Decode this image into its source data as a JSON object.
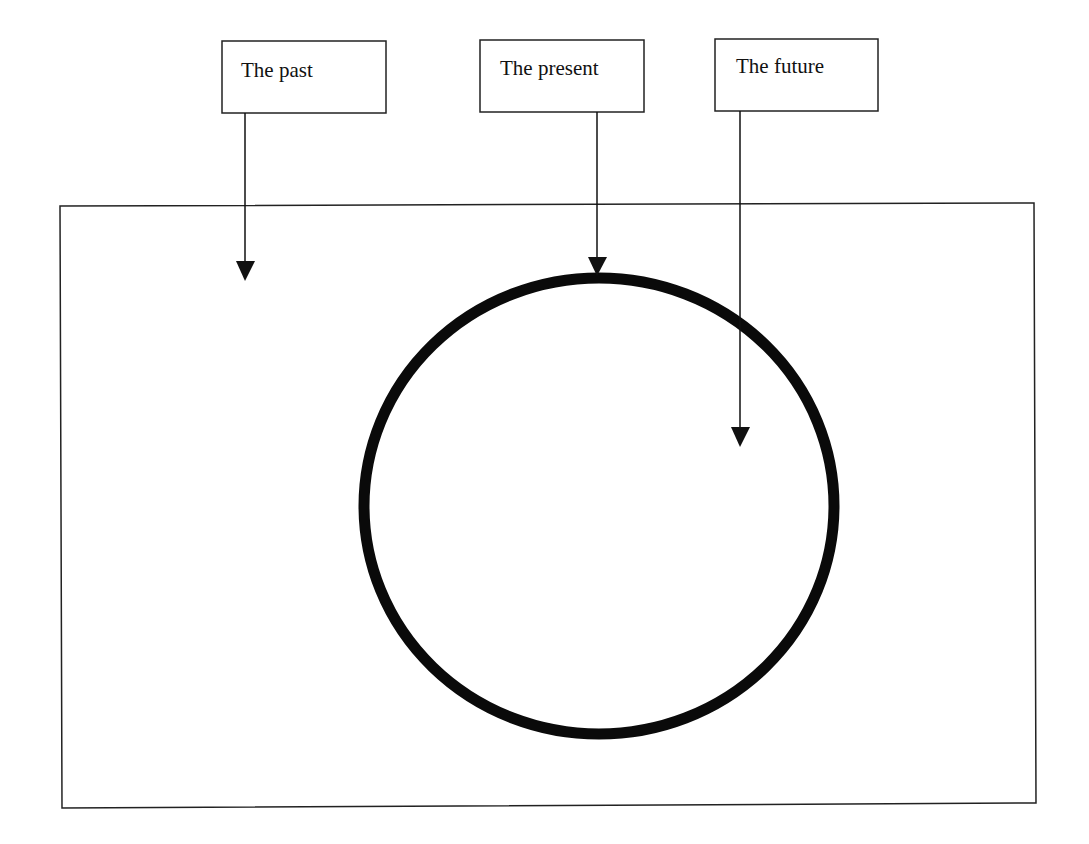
{
  "diagram": {
    "title": "",
    "labels": [
      {
        "id": "past",
        "text": "The past"
      },
      {
        "id": "present",
        "text": "The present"
      },
      {
        "id": "future",
        "text": "The future"
      }
    ],
    "elements": {
      "outer_frame": "rectangle",
      "center_shape": "circle"
    },
    "arrows": [
      {
        "from": "The past",
        "to": "area outside circle, inside frame"
      },
      {
        "from": "The present",
        "to": "circle boundary (top)"
      },
      {
        "from": "The future",
        "to": "area inside circle"
      }
    ],
    "colors": {
      "stroke": "#111111",
      "background": "#ffffff"
    }
  }
}
